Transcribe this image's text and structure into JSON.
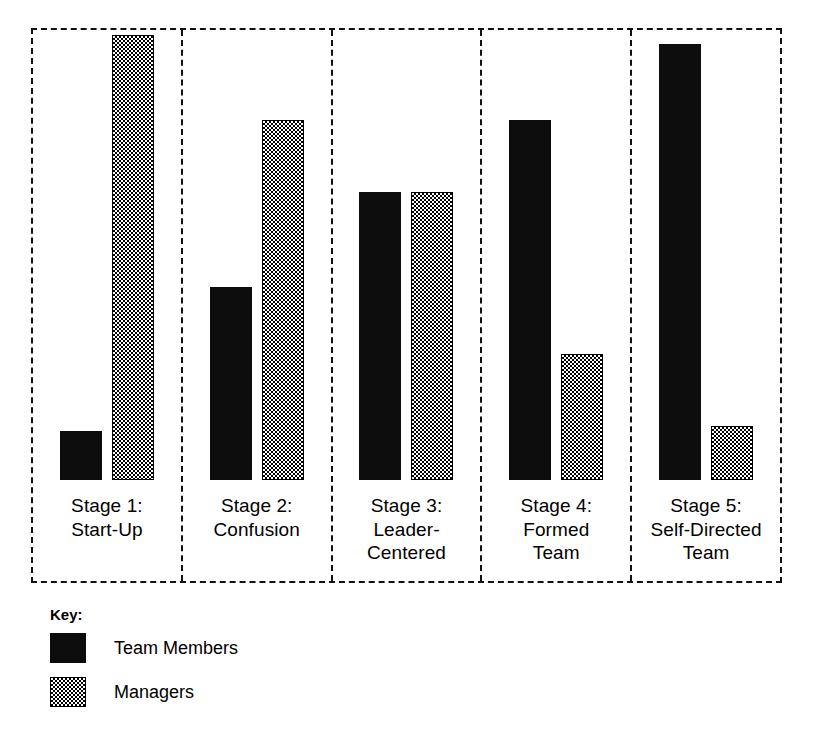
{
  "chart_data": {
    "type": "bar",
    "title": "",
    "subtitle": "",
    "xlabel": "",
    "ylabel": "",
    "ylim": [
      0,
      100
    ],
    "grid": false,
    "legend_position": "below-left",
    "orientation": "vertical",
    "grouping": "grouped-panels",
    "categories": [
      "Stage 1:\nStart-Up",
      "Stage 2:\nConfusion",
      "Stage 3:\nLeader-\nCentered",
      "Stage 4:\nFormed\nTeam",
      "Stage 5:\nSelf-Directed\nTeam"
    ],
    "series": [
      {
        "name": "Team Members",
        "fill": "solid-black",
        "color": "#0d0d0d",
        "values": [
          11,
          43,
          64,
          80,
          97
        ]
      },
      {
        "name": "Managers",
        "fill": "checkerboard-stipple",
        "color": "#808080",
        "values": [
          99,
          80,
          64,
          28,
          12
        ]
      }
    ],
    "annotations": []
  },
  "legend": {
    "title": "Key:",
    "entries": [
      {
        "label": "Team Members",
        "swatch": "solid-black-swatch"
      },
      {
        "label": "Managers",
        "swatch": "stippled-gray-swatch"
      }
    ]
  },
  "frame": {
    "border_style": "dashed",
    "border_color": "#111111",
    "divider_style": "dashed"
  }
}
